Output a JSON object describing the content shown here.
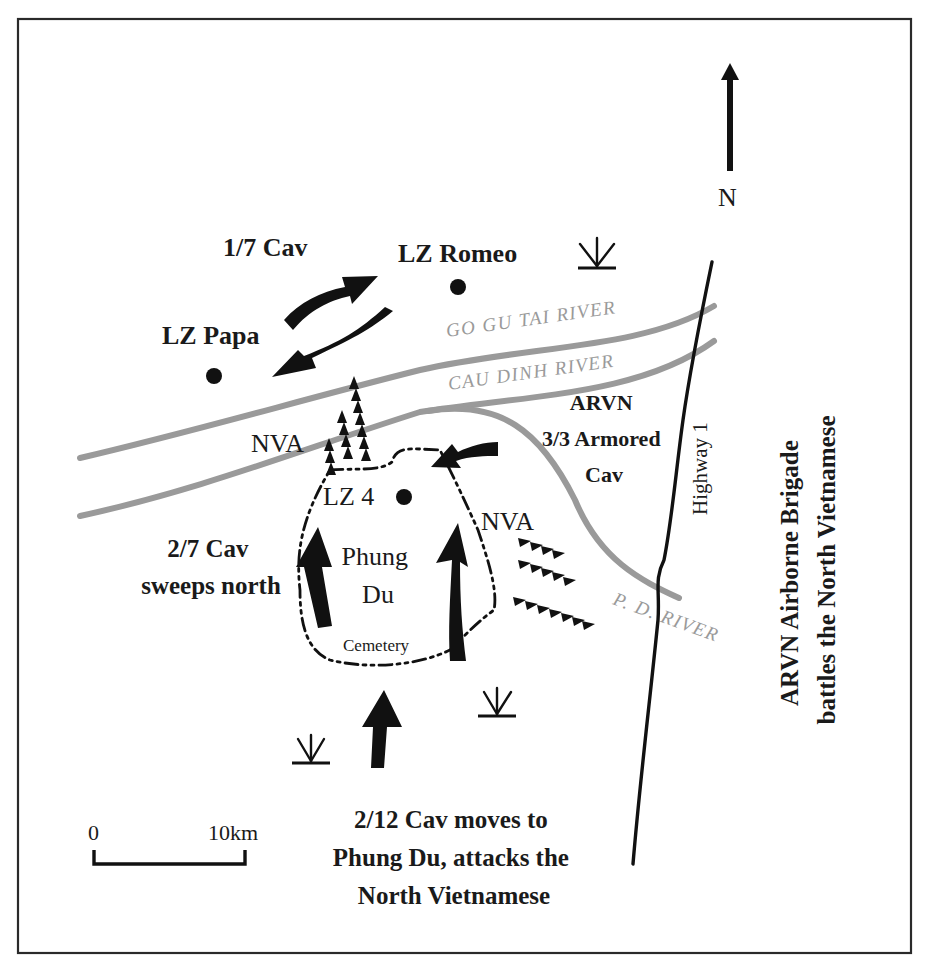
{
  "map": {
    "north_label": "N",
    "landing_zones": [
      {
        "id": "lz-romeo",
        "label": "LZ Romeo",
        "x": 458,
        "y": 287,
        "lx": 398,
        "ly": 262
      },
      {
        "id": "lz-papa",
        "label": "LZ Papa",
        "x": 214,
        "y": 376,
        "lx": 162,
        "ly": 344
      },
      {
        "id": "lz-4",
        "label": "LZ 4",
        "x": 404,
        "y": 497,
        "lx": 323,
        "ly": 505
      }
    ],
    "rivers": [
      {
        "id": "go-gu-tai-river",
        "label": "GO GU TAI RIVER"
      },
      {
        "id": "cau-dinh-river",
        "label": "CAU DINH RIVER"
      },
      {
        "id": "p-d-river",
        "label": "P. D. RIVER"
      }
    ],
    "road": {
      "label": "Highway 1"
    },
    "units": {
      "cav_1_7": "1/7 Cav",
      "nva_north": "NVA",
      "nva_east": "NVA",
      "arvn_armored": [
        "ARVN",
        "3/3 Armored",
        "Cav"
      ],
      "cav_2_7": [
        "2/7 Cav",
        "sweeps north"
      ],
      "cav_2_12": [
        "2/12 Cav moves to",
        "Phung Du, attacks the",
        "North Vietnamese"
      ],
      "arvn_airborne": [
        "ARVN Airborne Brigade",
        "battles the North Vietnamese"
      ]
    },
    "places": {
      "phung_du": [
        "Phung",
        "Du"
      ],
      "cemetery": "Cemetery"
    },
    "scale": {
      "start": "0",
      "end": "10km"
    },
    "colors": {
      "ink": "#111111",
      "river": "#9a9a9a",
      "frame": "#2a2a2a",
      "background": "#ffffff"
    }
  }
}
